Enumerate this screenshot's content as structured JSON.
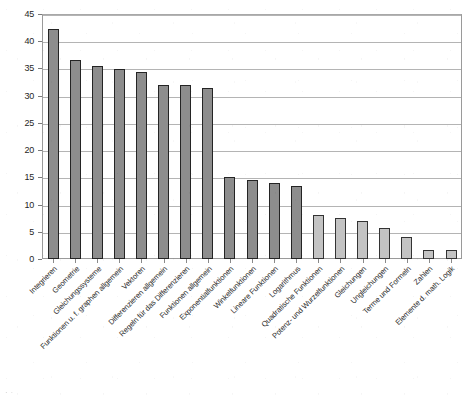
{
  "chart_data": {
    "type": "bar",
    "title": "",
    "subtitle": "",
    "xlabel": "",
    "ylabel": "",
    "ylim": [
      0,
      45
    ],
    "ytick_step": 5,
    "yticks": [
      "45",
      "40",
      "35",
      "30",
      "25",
      "20",
      "15",
      "10",
      "5",
      "0"
    ],
    "grid": true,
    "legend": false,
    "legend_position": "none",
    "orientation": "vertical",
    "bar_color": "#8d8d8d",
    "bar_color_light": "#c3c3c3",
    "bar_edge_color": "#242424",
    "grid_color": "#b4b4b4",
    "axis_color": "#9a9a9a",
    "categories": [
      "Integrieren",
      "Geometrie",
      "Gleichungssysteme",
      "Funktionen u. f. graphen allgemein",
      "Vektoren",
      "Differenzieren allgemein",
      "Regeln für das Differenzieren",
      "Funktionen allgemein",
      "Exponentialfunktionen",
      "Winkelfunktionen",
      "Lineare Funktionen",
      "Logarithmus",
      "Quadratische Funktionen",
      "Potenz- und Wurzelfunktionen",
      "Gleichungen",
      "Ungleichungen",
      "Terme und Formeln",
      "Zahlen",
      "Elemente d. math. Logik"
    ],
    "values": [
      42.3,
      36.6,
      35.4,
      34.9,
      34.3,
      32.0,
      32.0,
      31.4,
      15.1,
      14.5,
      14.0,
      13.4,
      8.0,
      7.6,
      6.9,
      5.7,
      4.0,
      1.7,
      1.7
    ],
    "shade": [
      "dark",
      "dark",
      "dark",
      "dark",
      "dark",
      "dark",
      "dark",
      "dark",
      "dark",
      "dark",
      "dark",
      "dark",
      "light",
      "light",
      "light",
      "light",
      "light",
      "light",
      "light"
    ]
  },
  "caption": {
    "text": "",
    "visible": false
  }
}
